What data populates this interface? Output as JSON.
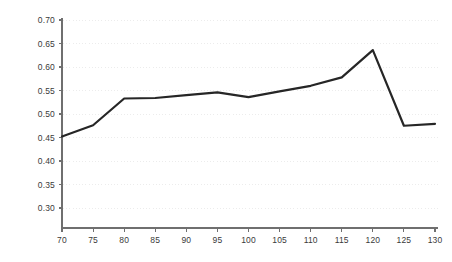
{
  "chart_data": {
    "type": "line",
    "title": "",
    "subtitle": "",
    "xlabel": "",
    "ylabel": "",
    "x": [
      70,
      75,
      80,
      85,
      90,
      95,
      100,
      105,
      110,
      115,
      120,
      125,
      130
    ],
    "series": [
      {
        "name": "series-1",
        "color": "#262626",
        "values": [
          0.452,
          0.476,
          0.533,
          0.534,
          0.54,
          0.546,
          0.536,
          0.548,
          0.56,
          0.578,
          0.636,
          0.475,
          0.479
        ]
      }
    ],
    "xlim": [
      70,
      130
    ],
    "ylim": [
      0.275,
      0.7
    ],
    "xticks": [
      70,
      75,
      80,
      85,
      90,
      95,
      100,
      105,
      110,
      115,
      120,
      125,
      130
    ],
    "xtick_labels": [
      "70",
      "75",
      "80",
      "85",
      "90",
      "95",
      "100",
      "105",
      "110",
      "115",
      "120",
      "125",
      "130"
    ],
    "yticks": [
      0.3,
      0.35,
      0.4,
      0.45,
      0.5,
      0.55,
      0.6,
      0.65,
      0.7
    ],
    "ytick_labels": [
      "0.30",
      "0.35",
      "0.40",
      "0.45",
      "0.50",
      "0.55",
      "0.60",
      "0.65",
      "0.70"
    ],
    "grid": {
      "horizontal": true,
      "vertical": false,
      "style": "dotted",
      "color": "#ececec"
    },
    "legend": {
      "visible": false,
      "position": "none",
      "entries": []
    },
    "annotations": [],
    "axis": {
      "spine_color": "#6f6f6f",
      "tick_color": "#6f6f6f",
      "left_visible": true,
      "bottom_visible": true,
      "top_visible": false,
      "right_visible": false
    },
    "line_width": 2.2
  }
}
